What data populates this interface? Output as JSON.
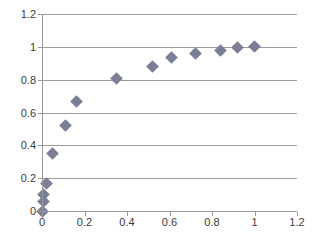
{
  "chart_data": {
    "type": "scatter",
    "title": "",
    "xlabel": "",
    "ylabel": "",
    "xlim": [
      0,
      1.2
    ],
    "ylim": [
      0,
      1.2
    ],
    "grid": "horizontal",
    "legend": "none",
    "marker": {
      "shape": "diamond",
      "color": "#7b7f95",
      "size": 9
    },
    "axis_color": "#9a9a9a",
    "tick_label_color": "#3b3b3b",
    "xticks": [
      "0",
      "0.2",
      "0.4",
      "0.6",
      "0.8",
      "1",
      "1.2"
    ],
    "xtick_values": [
      0,
      0.2,
      0.4,
      0.6,
      0.8,
      1,
      1.2
    ],
    "yticks": [
      "0",
      "0.2",
      "0.4",
      "0.6",
      "0.8",
      "1",
      "1.2"
    ],
    "ytick_values": [
      0,
      0.2,
      0.4,
      0.6,
      0.8,
      1,
      1.2
    ],
    "series": [
      {
        "name": "series1",
        "points": [
          [
            0.0,
            0.0
          ],
          [
            0.005,
            0.06
          ],
          [
            0.008,
            0.1
          ],
          [
            0.02,
            0.17
          ],
          [
            0.05,
            0.35
          ],
          [
            0.11,
            0.52
          ],
          [
            0.16,
            0.67
          ],
          [
            0.35,
            0.81
          ],
          [
            0.52,
            0.88
          ],
          [
            0.61,
            0.935
          ],
          [
            0.72,
            0.96
          ],
          [
            0.84,
            0.98
          ],
          [
            0.92,
            0.995
          ],
          [
            1.0,
            1.005
          ]
        ]
      }
    ]
  }
}
